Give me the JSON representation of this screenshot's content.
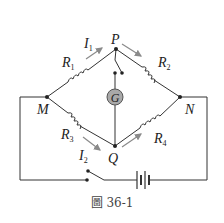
{
  "figure": {
    "caption": "圖 36-1",
    "type": "Wheatstone bridge circuit",
    "nodes": {
      "P": "P",
      "Q": "Q",
      "M": "M",
      "N": "N"
    },
    "resistors": [
      {
        "name": "R",
        "sub": "1",
        "branch": "M-P"
      },
      {
        "name": "R",
        "sub": "2",
        "branch": "P-N"
      },
      {
        "name": "R",
        "sub": "3",
        "branch": "M-Q"
      },
      {
        "name": "R",
        "sub": "4",
        "branch": "Q-N"
      }
    ],
    "currents": [
      {
        "name": "I",
        "sub": "1"
      },
      {
        "name": "I",
        "sub": "2"
      }
    ],
    "galvanometer": "G",
    "components": [
      "switch-key",
      "battery",
      "galvanometer-switch"
    ],
    "colors": {
      "wire": "#333333",
      "arrow": "#8a8a8a",
      "galvanometer_fill": "#a9a9a9"
    }
  }
}
